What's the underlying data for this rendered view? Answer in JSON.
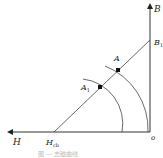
{
  "diagram": {
    "axes": {
      "vertical_label": "B",
      "horizontal_label": "H",
      "origin_label": "o"
    },
    "points": {
      "b1": {
        "label": "B",
        "subscript": "1"
      },
      "hcb": {
        "label": "H",
        "subscript": "cb"
      },
      "a": {
        "label": "A"
      },
      "a1": {
        "label": "A",
        "subscript": "1"
      }
    },
    "caption": "图 — 去磁曲线"
  }
}
